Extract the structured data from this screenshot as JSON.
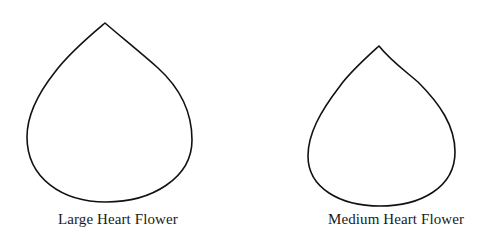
{
  "templates": [
    {
      "id": "large",
      "label": "Large Heart Flower",
      "stroke_color": "#111111"
    },
    {
      "id": "medium",
      "label": "Medium Heart Flower",
      "stroke_color": "#111111"
    }
  ],
  "colors": {
    "background": "#ffffff",
    "outline": "#111111",
    "text": "#1a1a1a"
  }
}
